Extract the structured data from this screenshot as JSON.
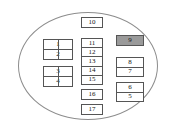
{
  "diagram": {
    "shape": "ellipse",
    "outline_color": "#8d8d8d",
    "box_border_color": "#555555",
    "highlight_color": "#9a9a9a",
    "background_color": "#ffffff",
    "groups": {
      "left": [
        {
          "id": "box-1-2",
          "labels": [
            "1",
            "2"
          ],
          "highlighted": false
        },
        {
          "id": "box-3-4",
          "labels": [
            "3",
            "4"
          ],
          "highlighted": false
        }
      ],
      "center": [
        {
          "id": "box-10",
          "labels": [
            "10"
          ],
          "highlighted": false
        },
        {
          "id": "box-11-15",
          "labels": [
            "11",
            "12",
            "13",
            "14",
            "15"
          ],
          "highlighted": false
        },
        {
          "id": "box-16",
          "labels": [
            "16"
          ],
          "highlighted": false
        },
        {
          "id": "box-17",
          "labels": [
            "17"
          ],
          "highlighted": false
        }
      ],
      "right": [
        {
          "id": "box-9",
          "labels": [
            "9"
          ],
          "highlighted": true
        },
        {
          "id": "box-8-7",
          "labels": [
            "8",
            "7"
          ],
          "highlighted": false
        },
        {
          "id": "box-6-5",
          "labels": [
            "6",
            "5"
          ],
          "highlighted": false
        }
      ]
    }
  }
}
